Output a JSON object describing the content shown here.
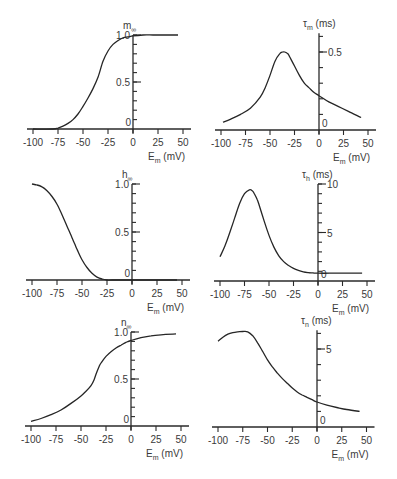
{
  "figure": {
    "x_label": "E",
    "x_label_sub": "m",
    "x_label_unit": "(mV)"
  },
  "chart_data": [
    {
      "id": "m_inf",
      "type": "line",
      "title": "",
      "ylabel": "m",
      "ylabel_sub": "∞",
      "ylabel_unit": "",
      "xlabel": "E_m (mV)",
      "xticks": [
        -100,
        -75,
        -50,
        -25,
        0,
        25,
        50
      ],
      "xtick_labels": [
        "-100",
        "-75",
        "-50",
        "-25",
        "0",
        "25",
        "50"
      ],
      "xlim": [
        -100,
        50
      ],
      "ylim": [
        0,
        1.0
      ],
      "ymax_axis": 1.0,
      "yticks_major": [
        0,
        0.5,
        1.0
      ],
      "ytick_labels": [
        "0",
        "0.5",
        "1.0"
      ],
      "yticks_minor_step": 0.1,
      "grid": false,
      "x": [
        -100,
        -80,
        -75,
        -70,
        -65,
        -60,
        -55,
        -50,
        -45,
        -40,
        -35,
        -30,
        -25,
        -20,
        -15,
        -10,
        -5,
        0,
        10,
        20,
        30,
        45
      ],
      "y": [
        0.0,
        0.0,
        0.01,
        0.03,
        0.06,
        0.1,
        0.16,
        0.24,
        0.33,
        0.43,
        0.55,
        0.72,
        0.83,
        0.9,
        0.94,
        0.97,
        0.98,
        0.99,
        1.0,
        1.0,
        1.0,
        1.0
      ]
    },
    {
      "id": "tau_m",
      "type": "line",
      "title": "",
      "ylabel": "τ",
      "ylabel_sub": "m",
      "ylabel_unit": "(ms)",
      "xlabel": "E_m (mV)",
      "xticks": [
        -100,
        -75,
        -50,
        -25,
        0,
        25,
        50
      ],
      "xtick_labels": [
        "-100",
        "-75",
        "-50",
        "-25",
        "0",
        "25",
        "50"
      ],
      "xlim": [
        -100,
        50
      ],
      "ylim": [
        0,
        0.5
      ],
      "ymax_axis": 0.62,
      "yticks_major": [
        0,
        0.5
      ],
      "ytick_labels": [
        "0",
        "0.5"
      ],
      "yticks_minor_step": 0.1,
      "grid": false,
      "x": [
        -98,
        -90,
        -80,
        -70,
        -60,
        -55,
        -50,
        -45,
        -40,
        -37,
        -35,
        -32,
        -30,
        -25,
        -20,
        -15,
        -10,
        -5,
        0,
        10,
        20,
        30,
        43
      ],
      "y": [
        0.05,
        0.07,
        0.1,
        0.14,
        0.21,
        0.27,
        0.35,
        0.44,
        0.49,
        0.5,
        0.5,
        0.49,
        0.47,
        0.41,
        0.35,
        0.3,
        0.27,
        0.24,
        0.22,
        0.18,
        0.15,
        0.12,
        0.08
      ]
    },
    {
      "id": "h_inf",
      "type": "line",
      "title": "",
      "ylabel": "h",
      "ylabel_sub": "∞",
      "ylabel_unit": "",
      "xlabel": "E_m (mV)",
      "xticks": [
        -100,
        -75,
        -50,
        -25,
        0,
        25,
        50
      ],
      "xtick_labels": [
        "-100",
        "-75",
        "-50",
        "-25",
        "0",
        "25",
        "50"
      ],
      "xlim": [
        -100,
        50
      ],
      "ylim": [
        0,
        1.0
      ],
      "ymax_axis": 1.0,
      "yticks_major": [
        0,
        0.5,
        1.0
      ],
      "ytick_labels": [
        "0",
        "0.5",
        "1.0"
      ],
      "yticks_minor_step": 0.1,
      "grid": false,
      "x": [
        -100,
        -95,
        -90,
        -85,
        -80,
        -75,
        -70,
        -65,
        -62,
        -60,
        -57,
        -55,
        -50,
        -45,
        -40,
        -35,
        -30,
        -25,
        -20,
        0,
        20,
        45
      ],
      "y": [
        1.0,
        0.99,
        0.97,
        0.93,
        0.87,
        0.79,
        0.68,
        0.56,
        0.49,
        0.44,
        0.37,
        0.32,
        0.21,
        0.13,
        0.07,
        0.03,
        0.01,
        0.0,
        0.0,
        0.0,
        0.0,
        0.0
      ]
    },
    {
      "id": "tau_h",
      "type": "line",
      "title": "",
      "ylabel": "τ",
      "ylabel_sub": "h",
      "ylabel_unit": "(ms)",
      "xlabel": "E_m (mV)",
      "xticks": [
        -100,
        -75,
        -50,
        -25,
        0,
        25,
        50
      ],
      "xtick_labels": [
        "-100",
        "-75",
        "-50",
        "-25",
        "0",
        "25",
        "50"
      ],
      "xlim": [
        -100,
        50
      ],
      "ylim": [
        0,
        10
      ],
      "ymax_axis": 10,
      "yticks_major": [
        0,
        5,
        10
      ],
      "ytick_labels": [
        "0",
        "5",
        "10"
      ],
      "yticks_minor_step": 1,
      "grid": false,
      "x": [
        -100,
        -95,
        -90,
        -85,
        -80,
        -75,
        -70,
        -67,
        -65,
        -62,
        -60,
        -55,
        -50,
        -45,
        -40,
        -35,
        -30,
        -25,
        -20,
        -15,
        -10,
        -5,
        0,
        20,
        45
      ],
      "y": [
        2.5,
        3.6,
        5.0,
        6.5,
        8.0,
        9.0,
        9.4,
        9.3,
        9.0,
        8.4,
        7.8,
        6.2,
        4.7,
        3.5,
        2.6,
        2.0,
        1.6,
        1.3,
        1.1,
        0.95,
        0.87,
        0.83,
        0.8,
        0.8,
        0.8
      ]
    },
    {
      "id": "n_inf",
      "type": "line",
      "title": "",
      "ylabel": "n",
      "ylabel_sub": "∞",
      "ylabel_unit": "",
      "xlabel": "E_m (mV)",
      "xticks": [
        -100,
        -75,
        -50,
        -25,
        0,
        25,
        50
      ],
      "xtick_labels": [
        "-100",
        "-75",
        "-50",
        "-25",
        "0",
        "25",
        "50"
      ],
      "xlim": [
        -100,
        50
      ],
      "ylim": [
        0,
        1.0
      ],
      "ymax_axis": 1.0,
      "yticks_major": [
        0,
        0.5,
        1.0
      ],
      "ytick_labels": [
        "0",
        "0.5",
        "1.0"
      ],
      "yticks_minor_step": 0.1,
      "grid": false,
      "x": [
        -100,
        -90,
        -80,
        -70,
        -60,
        -50,
        -45,
        -40,
        -37,
        -35,
        -32,
        -30,
        -25,
        -20,
        -15,
        -10,
        -5,
        0,
        10,
        20,
        30,
        45
      ],
      "y": [
        0.05,
        0.08,
        0.12,
        0.17,
        0.24,
        0.32,
        0.37,
        0.43,
        0.49,
        0.55,
        0.63,
        0.67,
        0.74,
        0.79,
        0.83,
        0.86,
        0.89,
        0.91,
        0.94,
        0.96,
        0.97,
        0.98
      ]
    },
    {
      "id": "tau_n",
      "type": "line",
      "title": "",
      "ylabel": "τ",
      "ylabel_sub": "n",
      "ylabel_unit": "(ms)",
      "xlabel": "E_m (mV)",
      "xticks": [
        -100,
        -75,
        -50,
        -25,
        0,
        25,
        50
      ],
      "xtick_labels": [
        "-100",
        "-75",
        "-50",
        "-25",
        "0",
        "25",
        "50"
      ],
      "xlim": [
        -100,
        50
      ],
      "ylim": [
        0,
        6
      ],
      "ymax_axis": 6.2,
      "yticks_major": [
        0,
        5
      ],
      "ytick_labels": [
        "0",
        "5"
      ],
      "yticks_minor_step": 1,
      "grid": false,
      "x": [
        -100,
        -95,
        -90,
        -85,
        -80,
        -75,
        -70,
        -65,
        -60,
        -55,
        -50,
        -45,
        -40,
        -35,
        -30,
        -25,
        -20,
        -15,
        -10,
        -5,
        0,
        10,
        20,
        30,
        43
      ],
      "y": [
        5.5,
        5.75,
        5.95,
        6.05,
        6.1,
        6.12,
        6.1,
        5.85,
        5.4,
        4.85,
        4.3,
        3.85,
        3.45,
        3.1,
        2.8,
        2.5,
        2.25,
        2.05,
        1.9,
        1.75,
        1.6,
        1.4,
        1.25,
        1.12,
        1.0
      ]
    }
  ]
}
